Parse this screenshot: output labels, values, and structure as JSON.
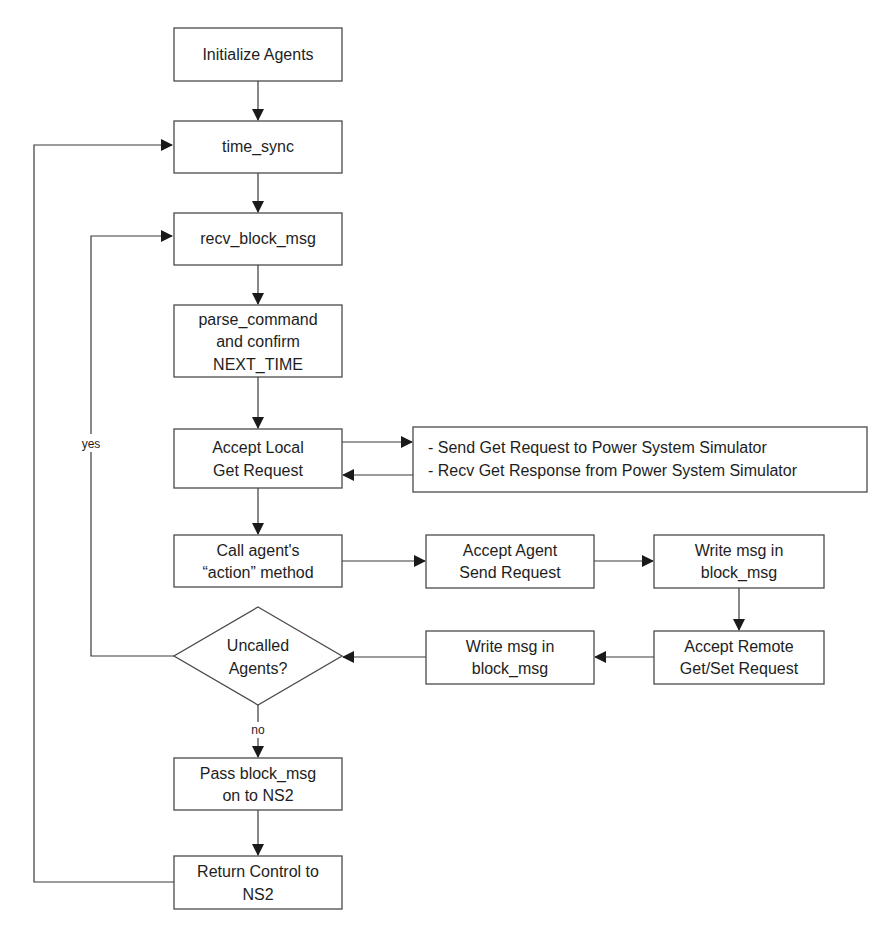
{
  "diagram": {
    "type": "flowchart",
    "nodes": {
      "initialize": {
        "lines": [
          "Initialize Agents"
        ]
      },
      "time_sync": {
        "lines": [
          "time_sync"
        ]
      },
      "recv_block_msg": {
        "lines": [
          "recv_block_msg"
        ]
      },
      "parse_command": {
        "lines": [
          "parse_command",
          "and confirm",
          "NEXT_TIME"
        ]
      },
      "accept_local_get": {
        "lines": [
          "Accept Local",
          "Get Request"
        ]
      },
      "power_sim": {
        "lines": [
          "- Send Get Request to Power System Simulator",
          "- Recv Get Response from Power System Simulator"
        ]
      },
      "call_action": {
        "lines": [
          "Call agent's",
          "“action” method"
        ]
      },
      "accept_agent_send": {
        "lines": [
          "Accept Agent",
          "Send Request"
        ]
      },
      "write_msg_top": {
        "lines": [
          "Write msg in",
          "block_msg"
        ]
      },
      "accept_remote": {
        "lines": [
          "Accept Remote",
          "Get/Set Request"
        ]
      },
      "write_msg_bottom": {
        "lines": [
          "Write msg in",
          "block_msg"
        ]
      },
      "uncalled_agents": {
        "lines": [
          "Uncalled",
          "Agents?"
        ]
      },
      "pass_block_msg": {
        "lines": [
          "Pass block_msg",
          "on to NS2"
        ]
      },
      "return_control": {
        "lines": [
          "Return Control to",
          "NS2"
        ]
      }
    },
    "edge_labels": {
      "yes": "yes",
      "no": "no"
    },
    "edges": [
      [
        "initialize",
        "time_sync"
      ],
      [
        "time_sync",
        "recv_block_msg"
      ],
      [
        "recv_block_msg",
        "parse_command"
      ],
      [
        "parse_command",
        "accept_local_get"
      ],
      [
        "accept_local_get",
        "power_sim"
      ],
      [
        "power_sim",
        "accept_local_get"
      ],
      [
        "accept_local_get",
        "call_action"
      ],
      [
        "call_action",
        "accept_agent_send"
      ],
      [
        "accept_agent_send",
        "write_msg_top"
      ],
      [
        "write_msg_top",
        "accept_remote"
      ],
      [
        "accept_remote",
        "write_msg_bottom"
      ],
      [
        "write_msg_bottom",
        "uncalled_agents"
      ],
      [
        "uncalled_agents",
        "recv_block_msg",
        "yes"
      ],
      [
        "uncalled_agents",
        "pass_block_msg",
        "no"
      ],
      [
        "pass_block_msg",
        "return_control"
      ],
      [
        "return_control",
        "time_sync"
      ]
    ]
  }
}
